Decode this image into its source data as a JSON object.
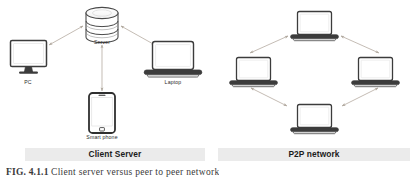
{
  "figure": {
    "caption_number": "FIG. 4.1.1",
    "caption_text": "Client server versus peer to peer network"
  },
  "panels": [
    {
      "id": "client-server",
      "title": "Client Server",
      "nodes": [
        {
          "id": "pc",
          "label": "PC",
          "icon": "desktop-monitor-icon"
        },
        {
          "id": "server",
          "label": "Server",
          "icon": "database-server-icon"
        },
        {
          "id": "laptop",
          "label": "Laptop",
          "icon": "laptop-icon"
        },
        {
          "id": "smart-phone",
          "label": "Smart phone",
          "icon": "smartphone-icon"
        }
      ],
      "connections": [
        {
          "from": "server",
          "to": "pc",
          "style": "double-arrow"
        },
        {
          "from": "server",
          "to": "laptop",
          "style": "double-arrow"
        },
        {
          "from": "server",
          "to": "smart-phone",
          "style": "double-arrow"
        }
      ]
    },
    {
      "id": "p2p-network",
      "title": "P2P network",
      "nodes": [
        {
          "id": "peer-top",
          "label": "",
          "icon": "laptop-icon"
        },
        {
          "id": "peer-left",
          "label": "",
          "icon": "laptop-icon"
        },
        {
          "id": "peer-right",
          "label": "",
          "icon": "laptop-icon"
        },
        {
          "id": "peer-bottom",
          "label": "",
          "icon": "laptop-icon"
        }
      ],
      "connections": [
        {
          "from": "peer-top",
          "to": "peer-left",
          "style": "double-arrow"
        },
        {
          "from": "peer-top",
          "to": "peer-right",
          "style": "double-arrow"
        },
        {
          "from": "peer-left",
          "to": "peer-bottom",
          "style": "double-arrow"
        },
        {
          "from": "peer-right",
          "to": "peer-bottom",
          "style": "double-arrow"
        }
      ]
    }
  ],
  "colors": {
    "band_background": "#ebebeb",
    "arrow": "#b9b0a6",
    "device_outline": "#3c3c3c",
    "device_fill": "#ffffff",
    "label_text": "#2b2b2b",
    "title_text": "#1c1c1c"
  }
}
